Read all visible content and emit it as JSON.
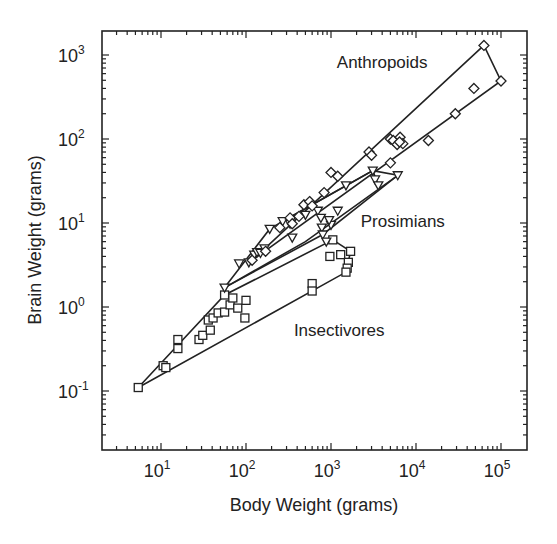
{
  "chart_data": {
    "type": "scatter",
    "title": "",
    "xlabel": "Body Weight (grams)",
    "ylabel": "Brain Weight (grams)",
    "xscale": "log",
    "yscale": "log",
    "xlim": [
      2.0,
      200000
    ],
    "ylim": [
      0.02,
      2000
    ],
    "grid": false,
    "legend": "none (groups labeled inline)",
    "x_ticks": [
      {
        "value": 10,
        "label": "10",
        "exp": "1"
      },
      {
        "value": 100,
        "label": "10",
        "exp": "2"
      },
      {
        "value": 1000,
        "label": "10",
        "exp": "3"
      },
      {
        "value": 10000,
        "label": "10",
        "exp": "4"
      },
      {
        "value": 100000,
        "label": "10",
        "exp": "5"
      }
    ],
    "y_ticks": [
      {
        "value": 0.1,
        "label": "10",
        "exp": "-1"
      },
      {
        "value": 1,
        "label": "10",
        "exp": "0"
      },
      {
        "value": 10,
        "label": "10",
        "exp": "1"
      },
      {
        "value": 100,
        "label": "10",
        "exp": "2"
      },
      {
        "value": 1000,
        "label": "10",
        "exp": "3"
      }
    ],
    "annotations": [
      {
        "text": "Anthropoids",
        "x": 4000,
        "y": 700
      },
      {
        "text": "Prosimians",
        "x": 7000,
        "y": 9
      },
      {
        "text": "Insectivores",
        "x": 1250,
        "y": 0.45
      }
    ],
    "series": [
      {
        "name": "Insectivores",
        "marker": "square",
        "points": [
          [
            5.4,
            0.11
          ],
          [
            10.6,
            0.2
          ],
          [
            11.4,
            0.19
          ],
          [
            15.8,
            0.41
          ],
          [
            15.8,
            0.32
          ],
          [
            28,
            0.41
          ],
          [
            31,
            0.46
          ],
          [
            36,
            0.7
          ],
          [
            38,
            0.53
          ],
          [
            41,
            0.74
          ],
          [
            47,
            0.85
          ],
          [
            56,
            0.87
          ],
          [
            56,
            1.39
          ],
          [
            65,
            1.06
          ],
          [
            70,
            1.28
          ],
          [
            80,
            0.97
          ],
          [
            97,
            0.74
          ],
          [
            100,
            1.2
          ],
          [
            600,
            1.9
          ],
          [
            600,
            1.55
          ],
          [
            1050,
            6.3
          ],
          [
            970,
            4.0
          ],
          [
            1300,
            4.2
          ],
          [
            1700,
            4.6
          ],
          [
            1600,
            3.4
          ],
          [
            1550,
            2.9
          ],
          [
            1500,
            2.6
          ]
        ],
        "hull": [
          [
            5.4,
            0.11
          ],
          [
            56,
            1.39
          ],
          [
            1050,
            6.3
          ],
          [
            1700,
            4.6
          ],
          [
            1500,
            2.6
          ]
        ]
      },
      {
        "name": "Prosimians",
        "marker": "triangle-down",
        "points": [
          [
            56,
            1.7
          ],
          [
            83,
            3.3
          ],
          [
            108,
            3.4
          ],
          [
            125,
            4.2
          ],
          [
            135,
            4.5
          ],
          [
            148,
            4.4
          ],
          [
            165,
            5.0
          ],
          [
            190,
            8.5
          ],
          [
            270,
            10.5
          ],
          [
            330,
            9.8
          ],
          [
            350,
            6.7
          ],
          [
            500,
            12.5
          ],
          [
            700,
            14.0
          ],
          [
            760,
            11.5
          ],
          [
            780,
            8.8
          ],
          [
            800,
            7.3
          ],
          [
            880,
            6.0
          ],
          [
            1000,
            9.5
          ],
          [
            1500,
            28
          ],
          [
            3100,
            42
          ],
          [
            3300,
            33
          ],
          [
            3600,
            28
          ],
          [
            6100,
            37
          ],
          [
            1200,
            14
          ],
          [
            950,
            10.8
          ]
        ],
        "hull": [
          [
            56,
            1.7
          ],
          [
            190,
            8.5
          ],
          [
            3100,
            42
          ],
          [
            6100,
            37
          ],
          [
            800,
            7.3
          ],
          [
            56,
            1.7
          ]
        ],
        "inner_paths": [
          [
            [
              56,
              1.7
            ],
            [
              500,
              6.0
            ],
            [
              6100,
              37
            ]
          ],
          [
            [
              270,
              10.5
            ],
            [
              3100,
              42
            ],
            [
              3600,
              28
            ]
          ]
        ]
      },
      {
        "name": "Anthropoids",
        "marker": "diamond",
        "points": [
          [
            118,
            3.6
          ],
          [
            170,
            4.6
          ],
          [
            250,
            8.8
          ],
          [
            330,
            11.5
          ],
          [
            350,
            9.8
          ],
          [
            420,
            12
          ],
          [
            480,
            16.5
          ],
          [
            560,
            18
          ],
          [
            600,
            16
          ],
          [
            830,
            23
          ],
          [
            1000,
            40
          ],
          [
            1200,
            36
          ],
          [
            2800,
            70
          ],
          [
            3000,
            64
          ],
          [
            5000,
            100
          ],
          [
            5400,
            96
          ],
          [
            6000,
            86
          ],
          [
            6500,
            105
          ],
          [
            7000,
            88
          ],
          [
            6400,
            92
          ],
          [
            5000,
            52
          ],
          [
            14000,
            96
          ],
          [
            29000,
            200
          ],
          [
            48000,
            400
          ],
          [
            63000,
            1300
          ],
          [
            100000,
            490
          ]
        ],
        "hull": [
          [
            118,
            3.6
          ],
          [
            63000,
            1300
          ],
          [
            100000,
            490
          ],
          [
            118,
            3.6
          ]
        ]
      }
    ]
  },
  "axes": {
    "x_title": "Body Weight (grams)",
    "y_title": "Brain Weight (grams)"
  }
}
